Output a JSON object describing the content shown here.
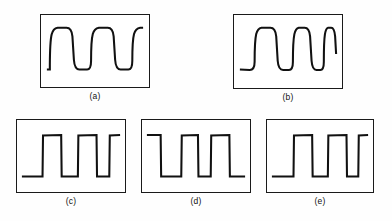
{
  "figure": {
    "background_color": "#ffffff",
    "line_color": "#111111",
    "border_color": "#1a1a1a",
    "panel_count": 5,
    "rows": 2
  },
  "panels": [
    {
      "id": "a",
      "label": "(a)",
      "waveform_type": "square-wave-with-sag",
      "pulse_count": 3,
      "notes": "Rounded leading corners with exponential droop on tops and bottoms; trace starts low at left, ends low at right",
      "path": "M 6,56 L 9,56 L 9,51 C 9.2,18 11,14 17,13 L 26,13 C 30,13 31.5,16 32,22 L 33.5,46 C 34,53 35.5,56 39,56 L 47,56 C 50,56 51,52 51,47 C 51,18 53,14 59,13 L 68,13 C 72,13 73.5,16 74,22 L 75.5,46 C 76,53 77.5,56 81,56 L 89,56 C 92,56 93,52 93,47 C 93,18 95,14 101,13 L 104,13"
    },
    {
      "id": "b",
      "label": "(b)",
      "waveform_type": "square-wave-with-sag-narrowing",
      "pulse_count": 4,
      "notes": "Four pulses of progressively decreasing width with drooping tops and bottoms; last pulse is narrowest",
      "path": "M 6,56 L 16,56.5 C 20,56.5 21,53 21,48 C 21,18 23,14 28,13 L 37,13 C 41,13 42.5,16 43,22 L 44.5,47 C 45,53.5 46.5,56.5 50,56.5 L 56,56.5 C 59,56.5 60,53 60,48 C 60,18 62,14 66,13 L 72,13 C 75.5,13 77,16 77.5,22 L 79,47 C 79.5,53.5 81,56.5 84,56.5 L 88,56.5 C 90.5,56.5 91.5,53 91.5,48 C 91.5,18 93,14 96,13 L 99,13 C 101.5,13 102.5,16 103,22 L 104,40"
    },
    {
      "id": "c",
      "label": "(c)",
      "waveform_type": "square-wave-clean",
      "pulse_count": 3,
      "notes": "Clean rectangular square wave, starts low at left, ends high at right, slight rounding on top-left corners",
      "path": "M 5,58 L 26,58 L 26.5,16 L 45,15.5 L 45.5,58 L 62,58 L 62.5,16 L 81,15.5 L 81.5,58 L 94,58 L 94.5,16 L 105,15.5"
    },
    {
      "id": "d",
      "label": "(d)",
      "waveform_type": "square-wave-clean-inverted-start",
      "pulse_count": 2,
      "notes": "Starts high at left, drops to low baseline, two full high pulses, ends low at right",
      "path": "M 5,15.5 L 19,15.5 L 19.5,58 L 40,58 L 40.5,16 L 57,15.5 L 57.5,58 L 70,58 L 70.5,16 L 89,15.5 L 89.5,58 L 105,58"
    },
    {
      "id": "e",
      "label": "(e)",
      "waveform_type": "square-wave-clean-narrow",
      "pulse_count": 3,
      "notes": "Clean square wave with narrower high pulses and wide low baseline, starts low, ends high at right",
      "path": "M 5,58 L 27,58 L 27.5,16 L 46,15.5 L 46.5,58 L 62,58 L 62.5,16 L 81,15.5 L 81.5,58 L 93,58 L 93.5,16 L 103,15.5"
    }
  ]
}
